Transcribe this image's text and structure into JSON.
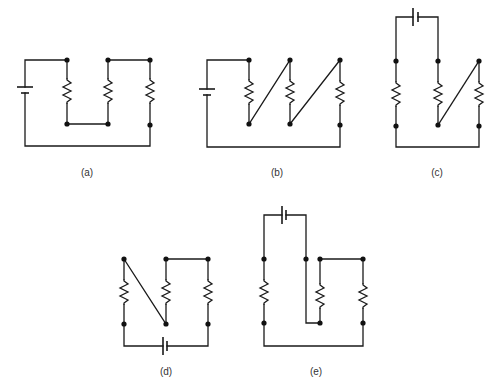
{
  "figure": {
    "type": "circuit-diagrams",
    "panels": [
      {
        "id": "a",
        "label": "(a)",
        "description": "Battery on left, three resistors; R1 and R2 bottoms joined, R2 and R3 tops joined"
      },
      {
        "id": "b",
        "label": "(b)",
        "description": "Battery on left, three resistors in series connected by diagonal wires"
      },
      {
        "id": "c",
        "label": "(c)",
        "description": "Battery on top, three resistors; diagonal wire from middle bottom to right top"
      },
      {
        "id": "d",
        "label": "(d)",
        "description": "Battery on bottom, three resistors; diagonal wire from left top to middle bottom"
      },
      {
        "id": "e",
        "label": "(e)",
        "description": "Battery on top, three resistors; wire from middle node down to bottom of second resistor"
      }
    ]
  },
  "labels": {
    "a": "(a)",
    "b": "(b)",
    "c": "(c)",
    "d": "(d)",
    "e": "(e)"
  },
  "colors": {
    "wire": "#1a1a1a",
    "background": "#ffffff"
  }
}
